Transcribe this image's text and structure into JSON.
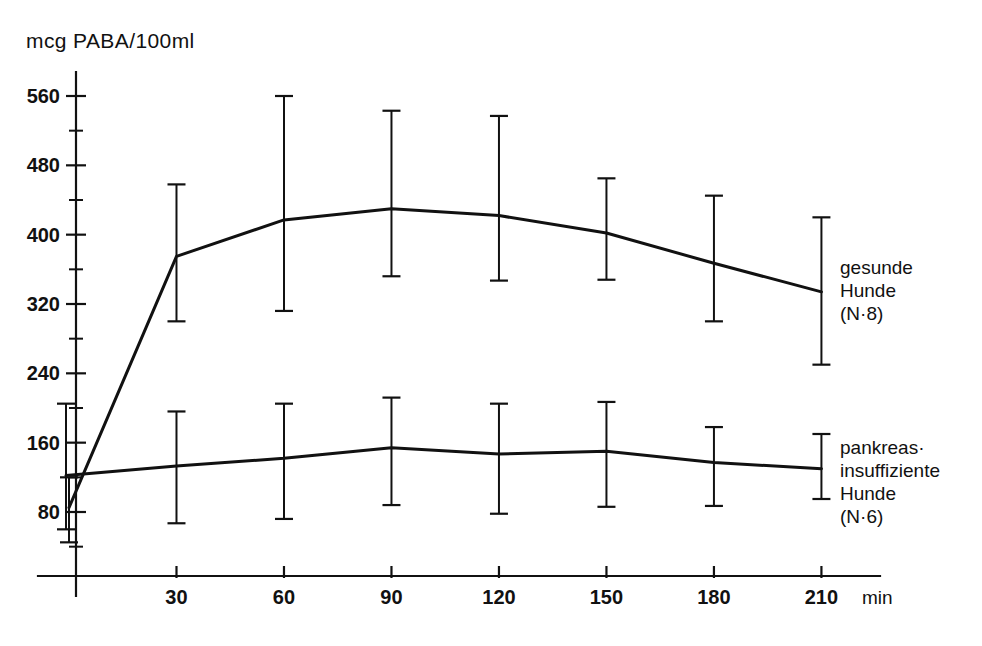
{
  "chart_data": {
    "type": "line",
    "title": "",
    "subtitle": "",
    "ylabel": "mcg PABA/100ml",
    "xlabel": "min",
    "x": [
      0,
      30,
      60,
      90,
      120,
      150,
      180,
      210
    ],
    "xticklabels": [
      "30",
      "60",
      "90",
      "120",
      "150",
      "180",
      "210"
    ],
    "xticks": [
      30,
      60,
      90,
      120,
      150,
      180,
      210
    ],
    "xlim": [
      0,
      215
    ],
    "yticklabels": [
      "560",
      "480",
      "400",
      "320",
      "240",
      "160",
      "80"
    ],
    "yticks": [
      560,
      480,
      400,
      320,
      240,
      160,
      80
    ],
    "yminorticks": [
      600,
      520,
      440,
      360,
      280,
      200,
      120,
      40
    ],
    "ylim": [
      20,
      600
    ],
    "grid": false,
    "legend_position": "right-inline",
    "errorbar_style": "capped-vertical",
    "series": [
      {
        "name": "gesunde Hunde (N=8)",
        "legend_lines": [
          "gesunde",
          "Hunde",
          "(N=8)"
        ],
        "n": 8,
        "values": [
          85,
          375,
          417,
          430,
          422,
          402,
          367,
          334
        ],
        "err_upper": [
          120,
          458,
          560,
          543,
          537,
          465,
          445,
          420
        ],
        "err_lower": [
          45,
          300,
          312,
          352,
          347,
          348,
          300,
          250
        ],
        "x_offset_first_point": 0
      },
      {
        "name": "pankreas-insuffiziente Hunde (N=6)",
        "legend_lines": [
          "pankreas·",
          "insuffiziente",
          "Hunde",
          "(N=6)"
        ],
        "n": 6,
        "values": [
          122,
          133,
          142,
          154,
          147,
          150,
          137,
          130
        ],
        "err_upper": [
          205,
          196,
          205,
          212,
          205,
          207,
          178,
          170
        ],
        "err_lower": [
          60,
          67,
          72,
          88,
          78,
          86,
          87,
          95
        ],
        "x_offset_first_point": -3
      }
    ]
  },
  "legend": {
    "healthy": {
      "line1": "gesunde",
      "line2": "Hunde",
      "line3": "(N·8)"
    },
    "insufficient": {
      "line1": "pankreas·",
      "line2": "insuffiziente",
      "line3": "Hunde",
      "line4": "(N·6)"
    }
  },
  "axes": {
    "y_title": "mcg PABA/100ml",
    "x_unit": "min",
    "y_labels": [
      "560",
      "480",
      "400",
      "320",
      "240",
      "160",
      "80"
    ],
    "x_labels": [
      "30",
      "60",
      "90",
      "120",
      "150",
      "180",
      "210"
    ]
  },
  "colors": {
    "ink": "#111111",
    "background": "#ffffff"
  }
}
